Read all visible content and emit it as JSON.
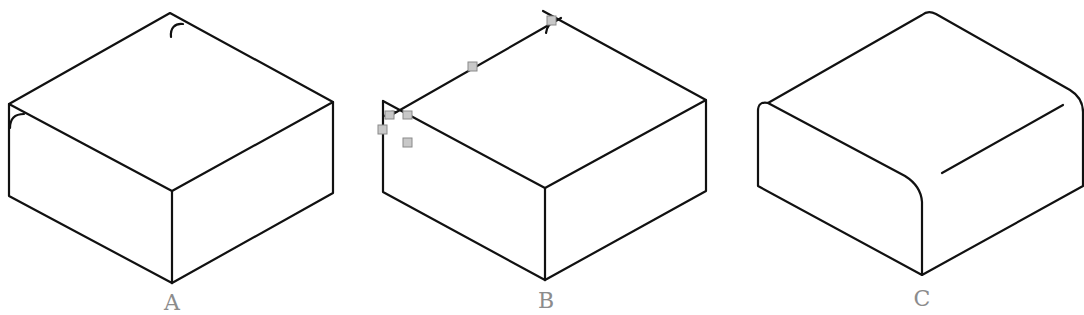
{
  "figure": {
    "panels": [
      {
        "id": "A",
        "label": "A",
        "label_color": "#8c8c8c",
        "feature": "sharp edges with small corner arc marks"
      },
      {
        "id": "B",
        "label": "B",
        "label_color": "#8c8c8c",
        "feature": "sharp edges with gray selection handles"
      },
      {
        "id": "C",
        "label": "C",
        "label_color": "#8c8c8c",
        "feature": "rounded (filleted) edges"
      }
    ],
    "line_color": "#111111",
    "marker_color": "#c8c8c8"
  }
}
